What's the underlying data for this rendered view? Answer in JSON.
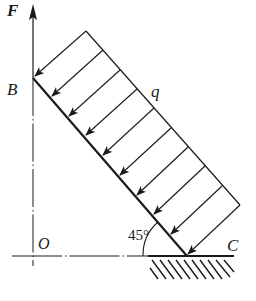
{
  "figure": {
    "labels": {
      "force": "F",
      "point_top": "B",
      "origin": "O",
      "point_bottom": "C",
      "distributed_load": "q",
      "angle": "45°"
    },
    "geometry": {
      "bar_angle_deg": 45,
      "load_arrow_count": 10,
      "support": "fixed ground (hatched) at C"
    },
    "colors": {
      "line": "#1a1a1a",
      "background": "#ffffff"
    }
  }
}
